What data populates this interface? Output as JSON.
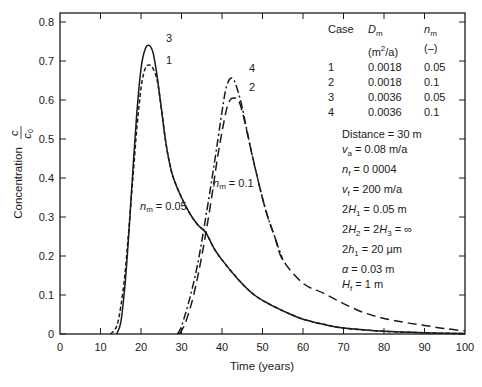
{
  "chart_data": {
    "type": "line",
    "title": "",
    "xlabel": "Time (years)",
    "ylabel": "Concentration c/c0",
    "xlim": [
      0,
      100
    ],
    "ylim": [
      0,
      0.8
    ],
    "xticks": [
      0,
      10,
      20,
      30,
      40,
      50,
      60,
      70,
      80,
      90,
      100
    ],
    "yticks": [
      0,
      0.1,
      0.2,
      0.3,
      0.4,
      0.5,
      0.6,
      0.7,
      0.8
    ],
    "ytick_labels": [
      "0",
      "0.1",
      "0.2",
      "0.3",
      "0.4",
      "0.5",
      "0.6",
      "0.7",
      "0.8"
    ],
    "grid": false,
    "series": [
      {
        "name": "1",
        "style": "short-dash",
        "D_m": "0.0018",
        "n_m": "0.05",
        "x": [
          12.5,
          14,
          15,
          16,
          17,
          18,
          19,
          20,
          21,
          22,
          23,
          24,
          25,
          26,
          27,
          28,
          30,
          32,
          34,
          36,
          38,
          40,
          44,
          48,
          52,
          56,
          60,
          65,
          70,
          80,
          90,
          100
        ],
        "y": [
          0,
          0.02,
          0.07,
          0.15,
          0.27,
          0.4,
          0.53,
          0.63,
          0.68,
          0.69,
          0.68,
          0.65,
          0.58,
          0.5,
          0.44,
          0.4,
          0.35,
          0.31,
          0.28,
          0.26,
          0.22,
          0.19,
          0.14,
          0.1,
          0.075,
          0.055,
          0.038,
          0.025,
          0.015,
          0.007,
          0.003,
          0.001
        ]
      },
      {
        "name": "2",
        "style": "long-dash",
        "D_m": "0.0018",
        "n_m": "0.1",
        "x": [
          29.5,
          31,
          33,
          35,
          37,
          39,
          41,
          42,
          43,
          44,
          45,
          47,
          49,
          51,
          53,
          55,
          60,
          65,
          70,
          75,
          80,
          85,
          90,
          95,
          100
        ],
        "y": [
          0,
          0.03,
          0.1,
          0.2,
          0.32,
          0.46,
          0.57,
          0.6,
          0.605,
          0.6,
          0.57,
          0.48,
          0.39,
          0.31,
          0.25,
          0.19,
          0.13,
          0.105,
          0.078,
          0.055,
          0.04,
          0.03,
          0.022,
          0.014,
          0.008
        ]
      },
      {
        "name": "3",
        "style": "solid",
        "D_m": "0.0036",
        "n_m": "0.05",
        "x": [
          14,
          15,
          16,
          17,
          18,
          19,
          20,
          21,
          22,
          23,
          24,
          25,
          26,
          27,
          28,
          30,
          32,
          34,
          36,
          38,
          40,
          44,
          48,
          52,
          56,
          60,
          65,
          70,
          80,
          90,
          100
        ],
        "y": [
          0,
          0.03,
          0.12,
          0.26,
          0.42,
          0.57,
          0.68,
          0.73,
          0.74,
          0.72,
          0.66,
          0.58,
          0.5,
          0.44,
          0.4,
          0.35,
          0.31,
          0.28,
          0.26,
          0.22,
          0.19,
          0.14,
          0.1,
          0.075,
          0.055,
          0.038,
          0.025,
          0.015,
          0.007,
          0.003,
          0.001
        ]
      },
      {
        "name": "4",
        "style": "dash-dot",
        "D_m": "0.0036",
        "n_m": "0.1",
        "x": [
          29,
          30,
          32,
          34,
          36,
          38,
          40,
          41,
          42,
          43,
          44,
          45,
          47,
          49,
          51,
          53,
          55
        ],
        "y": [
          0,
          0.02,
          0.09,
          0.18,
          0.3,
          0.43,
          0.57,
          0.63,
          0.655,
          0.65,
          0.62,
          0.58,
          0.48,
          0.39,
          0.31,
          0.25,
          0.19
        ]
      }
    ],
    "annotations": [
      {
        "text": "3",
        "x": 26.5,
        "y": 0.76
      },
      {
        "text": "1",
        "x": 26.5,
        "y": 0.7
      },
      {
        "text": "4",
        "x": 47.5,
        "y": 0.66
      },
      {
        "text": "2",
        "x": 47.5,
        "y": 0.61
      },
      {
        "text": "n_m = 0.05",
        "x": 19.5,
        "y": 0.33
      },
      {
        "text": "n_m = 0.1",
        "x": 37.5,
        "y": 0.42
      }
    ],
    "legend_table": {
      "headers": [
        "Case",
        "D_m (m²/a)",
        "n_m (–)"
      ],
      "rows": [
        [
          "1",
          "0.0018",
          "0.05"
        ],
        [
          "2",
          "0.0018",
          "0.1"
        ],
        [
          "3",
          "0.0036",
          "0.05"
        ],
        [
          "4",
          "0.0036",
          "0.1"
        ]
      ]
    },
    "parameters": [
      "Distance = 30 m",
      "v_a = 0.08 m/a",
      "n_f = 0 0004",
      "v_f = 200 m/a",
      "2H_1 = 0.05 m",
      "2H_2 = 2H_3 = ∞",
      "2h_1 = 20 µm",
      "α = 0.03 m",
      "H_f = 1 m"
    ]
  },
  "axes": {
    "xlabel": "Time (years)",
    "ylabel_word": "Concentration",
    "ylabel_num": "c",
    "ylabel_den": "c",
    "ylabel_den_sub": "0"
  },
  "legend": {
    "h_case": "Case",
    "h_dm": "D",
    "h_dm_sub": "m",
    "h_dm_unit_pre": "(m",
    "h_dm_unit_sup": "2",
    "h_dm_unit_post": "/a)",
    "h_nm": "n",
    "h_nm_sub": "m",
    "h_nm_unit": "(–)",
    "rows": [
      {
        "case": "1",
        "dm": "0.0018",
        "nm": "0.05"
      },
      {
        "case": "2",
        "dm": "0.0018",
        "nm": "0.1"
      },
      {
        "case": "3",
        "dm": "0.0036",
        "nm": "0.05"
      },
      {
        "case": "4",
        "dm": "0.0036",
        "nm": "0.1"
      }
    ]
  },
  "params": {
    "distance": "Distance = 30 m",
    "va_sym": "v",
    "va_sub": "a",
    "va_val": " = 0.08 m/a",
    "nf_sym": "n",
    "nf_sub": "f",
    "nf_val": " = 0 0004",
    "vf_sym": "v",
    "vf_sub": "f",
    "vf_val": " = 200 m/a",
    "h1_pre": "2",
    "h1_sym": "H",
    "h1_sub": "1",
    "h1_val": " = 0.05 m",
    "h23_pre": "2",
    "h23_sym": "H",
    "h23_sub": "2",
    "h23_mid": " = 2",
    "h23_sym2": "H",
    "h23_sub2": "3",
    "h23_val": " = ∞",
    "sh1_pre": "2",
    "sh1_sym": "h",
    "sh1_sub": "1",
    "sh1_val": " = 20 µm",
    "alpha_sym": "α",
    "alpha_val": " = 0.03 m",
    "hf_sym": "H",
    "hf_sub": "f",
    "hf_val": " = 1 m"
  },
  "labels": {
    "curve3": "3",
    "curve1": "1",
    "curve4": "4",
    "curve2": "2",
    "nm005_sym": "n",
    "nm005_sub": "m",
    "nm005_val": " = 0.05",
    "nm01_sym": "n",
    "nm01_sub": "m",
    "nm01_val": " = 0.1"
  }
}
